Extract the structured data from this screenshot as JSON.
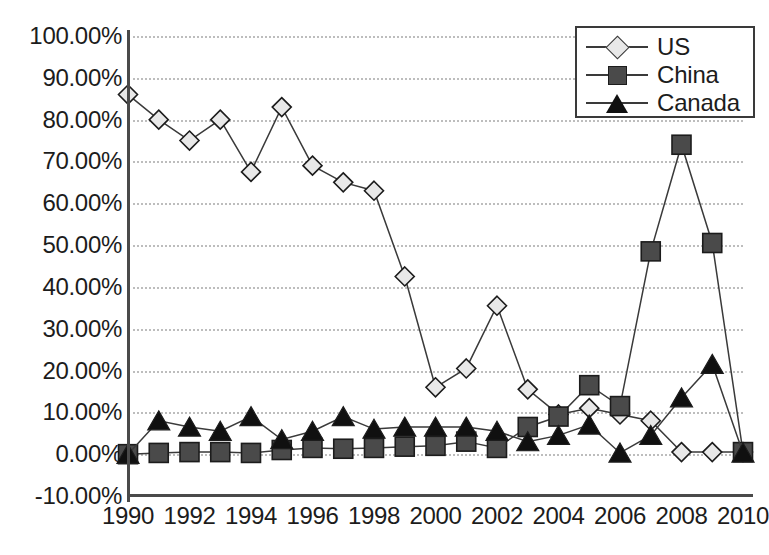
{
  "chart_data": {
    "type": "line",
    "title": "",
    "xlabel": "",
    "ylabel": "",
    "x": [
      1990,
      1991,
      1992,
      1993,
      1994,
      1995,
      1996,
      1997,
      1998,
      1999,
      2000,
      2001,
      2002,
      2003,
      2004,
      2005,
      2006,
      2007,
      2008,
      2009,
      2010
    ],
    "xtick_labels": [
      "1990",
      "1992",
      "1994",
      "1996",
      "1998",
      "2000",
      "2002",
      "2004",
      "2006",
      "2008",
      "2010"
    ],
    "xtick_values": [
      1990,
      1992,
      1994,
      1996,
      1998,
      2000,
      2002,
      2004,
      2006,
      2008,
      2010
    ],
    "xlim": [
      1990,
      2010
    ],
    "ylim": [
      -10,
      100
    ],
    "ytick_labels": [
      "100.00%",
      "90.00%",
      "80.00%",
      "70.00%",
      "60.00%",
      "50.00%",
      "40.00%",
      "30.00%",
      "20.00%",
      "10.00%",
      "0.00%",
      "-10.00%"
    ],
    "ytick_values": [
      100,
      90,
      80,
      70,
      60,
      50,
      40,
      30,
      20,
      10,
      0,
      -10
    ],
    "grid": true,
    "grid_style": "dotted",
    "grid_color": "#bdbdbd",
    "legend_position": "top-right",
    "series": [
      {
        "name": "US",
        "marker": "diamond",
        "marker_fill": "#e8e8e8",
        "line_color": "#3a3a3a",
        "values": [
          86.0,
          80.0,
          75.0,
          80.0,
          67.5,
          83.0,
          69.0,
          65.0,
          63.0,
          42.5,
          16.0,
          20.5,
          35.5,
          15.5,
          9.5,
          11.0,
          9.5,
          8.0,
          0.5,
          0.5,
          0.5
        ]
      },
      {
        "name": "China",
        "marker": "square",
        "marker_fill": "#4a4a4a",
        "line_color": "#3a3a3a",
        "values": [
          0.0,
          0.3,
          0.5,
          0.5,
          0.3,
          1.0,
          1.5,
          1.3,
          1.5,
          1.8,
          2.0,
          3.0,
          1.5,
          6.5,
          9.0,
          16.5,
          11.5,
          48.5,
          74.0,
          50.5,
          0.5
        ]
      },
      {
        "name": "Canada",
        "marker": "triangle",
        "marker_fill": "#101010",
        "line_color": "#3a3a3a",
        "values": [
          0.0,
          8.0,
          6.5,
          5.5,
          9.0,
          3.5,
          5.5,
          9.0,
          6.0,
          6.5,
          6.5,
          6.5,
          5.5,
          3.0,
          4.5,
          7.0,
          0.3,
          4.5,
          13.5,
          21.5,
          0.3
        ]
      }
    ]
  },
  "legend": {
    "items": [
      {
        "label": "US"
      },
      {
        "label": "China"
      },
      {
        "label": "Canada"
      }
    ]
  }
}
